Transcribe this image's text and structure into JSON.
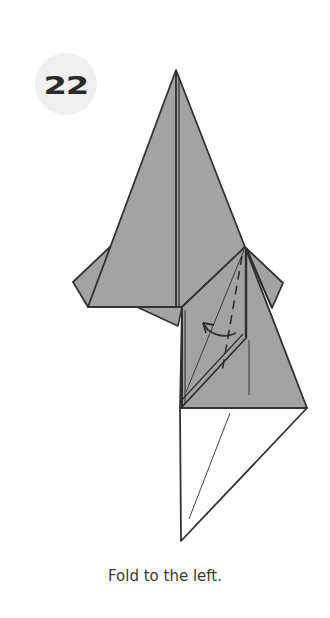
{
  "step": {
    "number": "22",
    "badge_color": "#f0f0f0",
    "number_color": "#2b2b2b"
  },
  "diagram": {
    "paper_colored_fill": "#a3a3a3",
    "paper_white_fill": "#ffffff",
    "line_color": "#333333",
    "elements": [
      "fold-arrow-left",
      "valley-fold-dashed-line",
      "crease-lines"
    ]
  },
  "caption": {
    "text": "Fold to the left."
  }
}
